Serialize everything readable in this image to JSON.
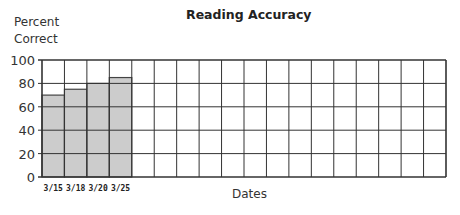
{
  "chart_data": {
    "type": "bar",
    "title": "Reading Accuracy",
    "xlabel": "Dates",
    "ylabel": "Percent Correct",
    "ylabel_lines": [
      "Percent",
      "Correct"
    ],
    "categories": [
      "3/15",
      "3/18",
      "3/20",
      "3/25"
    ],
    "values": [
      70,
      75,
      80,
      85
    ],
    "total_columns": 18,
    "ylim": [
      0,
      100
    ],
    "yticks": [
      0,
      20,
      40,
      60,
      80,
      100
    ],
    "grid": true,
    "bar_color": "#cccccc",
    "grid_color": "#333333"
  }
}
